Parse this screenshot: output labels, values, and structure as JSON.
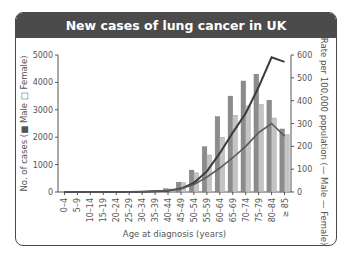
{
  "header": {
    "title": "New cases of lung cancer in UK"
  },
  "colors": {
    "header_bg": "#4b4b4b",
    "male_bar": "#8c8c8c",
    "female_bar": "#c4c4c4",
    "male_line": "#3c3c3c",
    "female_line": "#5a5a5a"
  },
  "chart_data": {
    "type": "bar",
    "title": "New cases of lung cancer in UK",
    "xlabel": "Age at diagnosis (years)",
    "ylabel": "No. of cases (Male, Female)",
    "ylabel_parts": {
      "prefix": "No. of cases (",
      "male": "Male",
      "female": "Female)"
    },
    "y2label": "Rate per 100,000 population (Male, Female)",
    "y2label_parts": {
      "prefix": "Rate per 100,000 population (",
      "male": "Male",
      "female": "Female)"
    },
    "ylim": [
      0,
      5000
    ],
    "y2lim": [
      0,
      600
    ],
    "yticks": [
      "0",
      "1000",
      "2000",
      "3000",
      "4000",
      "5000"
    ],
    "y2ticks": [
      "0",
      "100",
      "200",
      "300",
      "400",
      "500",
      "600"
    ],
    "categories": [
      "0–4",
      "5–9",
      "10–14",
      "15–19",
      "20–24",
      "25–29",
      "30–34",
      "35–39",
      "40–44",
      "45–49",
      "50–54",
      "55–59",
      "60–64",
      "65–69",
      "70–74",
      "75–79",
      "80–84",
      "≥ 85"
    ],
    "series": [
      {
        "name": "Male",
        "kind": "bar",
        "axis": "left",
        "values": [
          0,
          0,
          0,
          0,
          5,
          5,
          15,
          40,
          120,
          360,
          800,
          1650,
          2750,
          3500,
          4050,
          4300,
          3350,
          2300
        ]
      },
      {
        "name": "Female",
        "kind": "bar",
        "axis": "left",
        "values": [
          0,
          0,
          0,
          0,
          5,
          5,
          15,
          40,
          110,
          340,
          700,
          1350,
          2000,
          2800,
          3150,
          3200,
          2700,
          2100
        ]
      },
      {
        "name": "Male rate",
        "kind": "line",
        "axis": "right",
        "values": [
          0,
          0,
          0,
          0,
          0,
          0,
          1,
          3,
          6,
          15,
          40,
          90,
          170,
          260,
          345,
          460,
          590,
          570
        ]
      },
      {
        "name": "Female rate",
        "kind": "line",
        "axis": "right",
        "values": [
          0,
          0,
          0,
          0,
          0,
          0,
          1,
          3,
          6,
          14,
          33,
          65,
          105,
          150,
          200,
          260,
          300,
          245
        ]
      }
    ],
    "grid": false,
    "legend": "inline in axis labels"
  }
}
